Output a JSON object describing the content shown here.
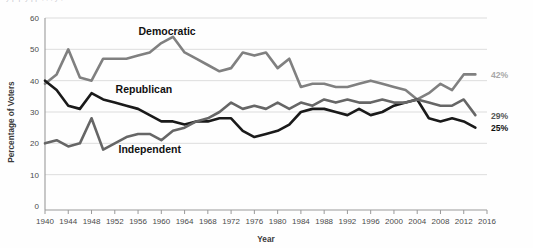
{
  "figure": {
    "clipped_header_text": "y  p  p          y  pp          ,        ,   ,  y                            ,",
    "background": "#fefefe"
  },
  "chart_data": {
    "type": "line",
    "title": "",
    "xlabel": "Year",
    "ylabel": "Percentage of Voters",
    "xlim": [
      1940,
      2016
    ],
    "ylim": [
      0,
      60
    ],
    "yticks": [
      0,
      10,
      20,
      30,
      40,
      50,
      60
    ],
    "xticks": [
      1940,
      1944,
      1948,
      1952,
      1956,
      1960,
      1964,
      1968,
      1972,
      1976,
      1980,
      1984,
      1988,
      1992,
      1996,
      2000,
      2004,
      2008,
      2012,
      2016
    ],
    "grid": "horizontal",
    "legend_position": "inline-annotations",
    "series": [
      {
        "name": "Democratic",
        "color": "#808080",
        "label_x": 1961,
        "label_y": 54.5,
        "end_label": "42%",
        "end_label_color": "#a8a8a8",
        "x": [
          1940,
          1942,
          1944,
          1946,
          1948,
          1950,
          1952,
          1954,
          1956,
          1958,
          1960,
          1962,
          1964,
          1966,
          1968,
          1970,
          1972,
          1974,
          1976,
          1978,
          1980,
          1982,
          1984,
          1986,
          1988,
          1990,
          1992,
          1994,
          1996,
          1998,
          2000,
          2002,
          2004,
          2006,
          2008,
          2010,
          2012,
          2014
        ],
        "y": [
          39,
          42,
          50,
          41,
          40,
          47,
          47,
          47,
          48,
          49,
          52,
          54,
          49,
          47,
          45,
          43,
          44,
          49,
          48,
          49,
          44,
          47,
          38,
          39,
          39,
          38,
          38,
          39,
          40,
          39,
          38,
          37,
          34,
          36,
          39,
          37,
          42,
          42
        ]
      },
      {
        "name": "Republican",
        "color": "#1a1a1a",
        "label_x": 1957,
        "label_y": 36,
        "end_label": "25%",
        "end_label_color": "#111111",
        "x": [
          1940,
          1942,
          1944,
          1946,
          1948,
          1950,
          1952,
          1954,
          1956,
          1958,
          1960,
          1962,
          1964,
          1966,
          1968,
          1970,
          1972,
          1974,
          1976,
          1978,
          1980,
          1982,
          1984,
          1986,
          1988,
          1990,
          1992,
          1994,
          1996,
          1998,
          2000,
          2002,
          2004,
          2006,
          2008,
          2010,
          2012,
          2014
        ],
        "y": [
          40,
          37,
          32,
          31,
          36,
          34,
          33,
          32,
          31,
          29,
          27,
          27,
          26,
          27,
          27,
          28,
          28,
          24,
          22,
          23,
          24,
          26,
          30,
          31,
          31,
          30,
          29,
          31,
          29,
          30,
          32,
          33,
          34,
          28,
          27,
          28,
          27,
          25
        ]
      },
      {
        "name": "Independent",
        "color": "#666666",
        "label_x": 1958,
        "label_y": 17,
        "end_label": "29%",
        "end_label_color": "#555555",
        "x": [
          1940,
          1942,
          1944,
          1946,
          1948,
          1950,
          1952,
          1954,
          1956,
          1958,
          1960,
          1962,
          1964,
          1966,
          1968,
          1970,
          1972,
          1974,
          1976,
          1978,
          1980,
          1982,
          1984,
          1986,
          1988,
          1990,
          1992,
          1994,
          1996,
          1998,
          2000,
          2002,
          2004,
          2006,
          2008,
          2010,
          2012,
          2014
        ],
        "y": [
          20,
          21,
          19,
          20,
          28,
          18,
          20,
          22,
          23,
          23,
          21,
          24,
          25,
          27,
          28,
          30,
          33,
          31,
          32,
          31,
          33,
          31,
          33,
          32,
          34,
          33,
          34,
          33,
          33,
          34,
          33,
          33,
          34,
          33,
          32,
          32,
          34,
          29
        ]
      }
    ]
  }
}
